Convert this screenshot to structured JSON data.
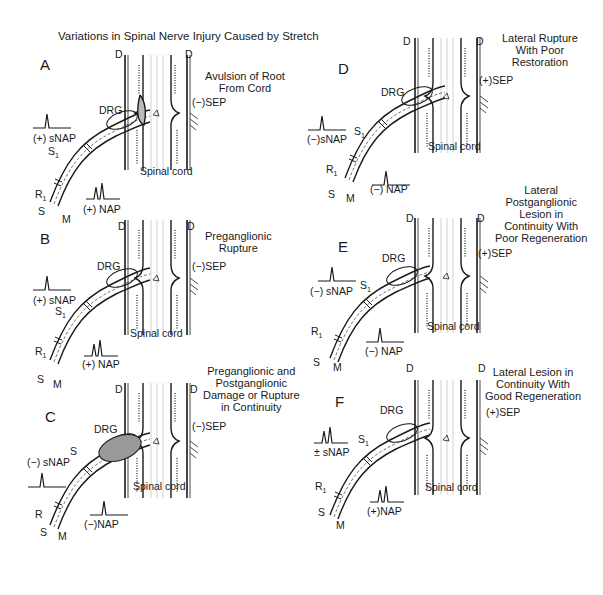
{
  "figure": {
    "title": "Variations in Spinal Nerve Injury Caused by Stretch",
    "colors": {
      "ink": "#1a1a1a",
      "background": "#ffffff",
      "shading": "#666666"
    }
  },
  "panels": [
    {
      "id": "A",
      "letter": "A",
      "caption": [
        "Avulsion of Root",
        "From Cord"
      ],
      "sep": "(−)SEP",
      "snap": "(+) sNAP",
      "nap": "(+) NAP",
      "dura_left": "D",
      "dura_right": "D",
      "drg": "DRG",
      "cord": "Spinal cord",
      "s1": "S",
      "r1": "R",
      "s": "S",
      "m": "M"
    },
    {
      "id": "B",
      "letter": "B",
      "caption": [
        "Preganglionic",
        "Rupture"
      ],
      "sep": "(−)SEP",
      "snap": "(+) sNAP",
      "nap": "(+) NAP",
      "dura_left": "D",
      "dura_right": "D",
      "drg": "DRG",
      "cord": "Spinal cord",
      "s1": "S",
      "r1": "R",
      "s": "S",
      "m": "M"
    },
    {
      "id": "C",
      "letter": "C",
      "caption": [
        "Preganglionic and",
        "Postganglionic",
        "Damage or Rupture",
        "in Continuity"
      ],
      "sep": "(−)SEP",
      "snap": "(−) sNAP",
      "nap": "(−)NAP",
      "dura_left": "D",
      "dura_right": "D",
      "drg": "DRG",
      "cord": "Spinal cord",
      "s1": "S",
      "r1": "R",
      "s": "S",
      "m": "M"
    },
    {
      "id": "D",
      "letter": "D",
      "caption": [
        "Lateral Rupture",
        "With Poor",
        "Restoration"
      ],
      "sep": "(+)SEP",
      "snap": "(−)sNAP",
      "nap": "(−) NAP",
      "dura_left": "D",
      "dura_right": "D",
      "drg": "DRG",
      "cord": "Spinal cord",
      "s1": "S",
      "r1": "R",
      "s": "S",
      "m": "M"
    },
    {
      "id": "E",
      "letter": "E",
      "caption": [
        "Lateral",
        "Postganglionic",
        "Lesion in",
        "Continuity With",
        "Poor Regeneration"
      ],
      "sep": "(+)SEP",
      "snap": "(−) sNAP",
      "nap": "(−) NAP",
      "dura_left": "D",
      "dura_right": "D",
      "drg": "DRG",
      "cord": "Spinal cord",
      "s1": "S",
      "r1": "R",
      "s": "S",
      "m": "M"
    },
    {
      "id": "F",
      "letter": "F",
      "caption": [
        "Lateral Lesion in",
        "Continuity With",
        "Good Regeneration"
      ],
      "sep": "(+)SEP",
      "snap": "± sNAP",
      "nap": "(+)NAP",
      "dura_left": "D",
      "dura_right": "D",
      "drg": "DRG",
      "cord": "Spinal cord",
      "s1": "S",
      "r1": "R",
      "s": "S",
      "m": "M"
    }
  ],
  "subscript": "1"
}
